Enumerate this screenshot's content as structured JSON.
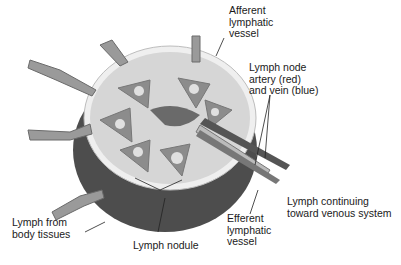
{
  "diagram": {
    "colors": {
      "capsule": "#5a5a5a",
      "cortex": "#d9d9d9",
      "nodule": "#8e8e8e",
      "germinal_center": "#dedede",
      "medulla": "#6e6e6e",
      "vessel": "#9a9a9a",
      "leader": "#222222"
    },
    "labels": {
      "afferent": "Afferent\nlymphatic\nvessel",
      "artery_vein": "Lymph node\nartery (red)\nand vein (blue)",
      "lymph_from": "Lymph from\nbody tissues",
      "nodule": "Lymph nodule",
      "efferent": "Efferent\nlymphatic\nvessel",
      "continuing": "Lymph continuing\ntoward venous system"
    }
  }
}
